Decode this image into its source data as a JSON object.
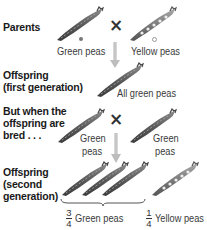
{
  "rows": {
    "parents": {
      "label": "Parents",
      "left_caption": "Green peas",
      "right_caption": "Yellow peas"
    },
    "offspring1": {
      "label_line1": "Offspring",
      "label_line2": "(first generation)",
      "caption": "All green peas"
    },
    "bred": {
      "label_line1": "But when the",
      "label_line2": "offspring are",
      "label_line3": "bred . . .",
      "left_caption_line1": "Green",
      "left_caption_line2": "peas",
      "right_caption_line1": "Green",
      "right_caption_line2": "peas"
    },
    "offspring2": {
      "label_line1": "Offspring",
      "label_line2": "(second",
      "label_line3": "generation)",
      "green_fraction": {
        "numerator": "3",
        "denominator": "4",
        "caption": "Green peas"
      },
      "yellow_fraction": {
        "numerator": "1",
        "denominator": "4",
        "caption": "Yellow peas"
      }
    }
  },
  "symbols": {
    "cross": "×"
  },
  "colors": {
    "pod_dark": "#5a5a5a",
    "pod_light": "#9a9a9a",
    "arrow": "#c8c8c8",
    "text": "#1a1a1a"
  }
}
